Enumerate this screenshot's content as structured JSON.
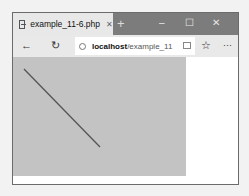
{
  "browser": {
    "tab": {
      "title": "example_11-6.php",
      "close_glyph": "✕"
    },
    "new_tab_glyph": "+",
    "window_controls": {
      "minimize": "–",
      "maximize": "☐",
      "close": "✕"
    },
    "toolbar": {
      "back_glyph": "←",
      "refresh_glyph": "↻",
      "url_host": "localhost",
      "url_path": "/example_11",
      "favorite_glyph": "☆",
      "more_glyph": "···"
    }
  },
  "page": {
    "canvas": {
      "background": "#c3c3c3",
      "line": {
        "x1": 11,
        "y1": 12,
        "x2": 87,
        "y2": 90,
        "color": "#555555"
      }
    }
  }
}
